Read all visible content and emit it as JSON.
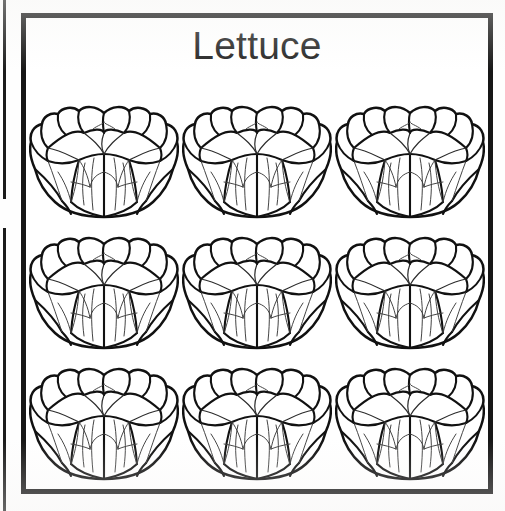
{
  "page": {
    "background_color": "#ffffff",
    "width": 505,
    "height": 511
  },
  "neighbor_card": {
    "name": "adjacent-card-edge",
    "description": "partial vertical border of the neighbouring card clipped at the left edge",
    "color": "#1b1b1b"
  },
  "card": {
    "title": "Lettuce",
    "border_color": "#161616",
    "background_color": "#ffffff",
    "item_count": 9,
    "grid": {
      "rows": 3,
      "columns": 3
    },
    "items": [
      {
        "label": "Lettuce",
        "icon": "lettuce-head-icon",
        "row": 1,
        "column": 1
      },
      {
        "label": "Lettuce",
        "icon": "lettuce-head-icon",
        "row": 1,
        "column": 2
      },
      {
        "label": "Lettuce",
        "icon": "lettuce-head-icon",
        "row": 1,
        "column": 3
      },
      {
        "label": "Lettuce",
        "icon": "lettuce-head-icon",
        "row": 2,
        "column": 1
      },
      {
        "label": "Lettuce",
        "icon": "lettuce-head-icon",
        "row": 2,
        "column": 2
      },
      {
        "label": "Lettuce",
        "icon": "lettuce-head-icon",
        "row": 2,
        "column": 3
      },
      {
        "label": "Lettuce",
        "icon": "lettuce-head-icon",
        "row": 3,
        "column": 1
      },
      {
        "label": "Lettuce",
        "icon": "lettuce-head-icon",
        "row": 3,
        "column": 2
      },
      {
        "label": "Lettuce",
        "icon": "lettuce-head-icon",
        "row": 3,
        "column": 3
      }
    ]
  }
}
